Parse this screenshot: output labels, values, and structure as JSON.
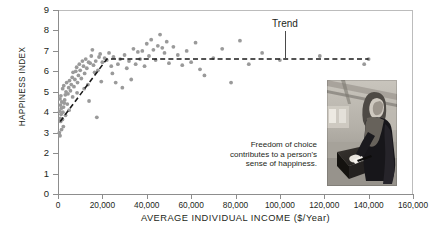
{
  "chart_data": {
    "type": "scatter",
    "title": "",
    "xlabel": "AVERAGE INDIVIDUAL INCOME ($/Year)",
    "ylabel": "HAPPINESS INDEX",
    "xlim": [
      0,
      160000
    ],
    "ylim": [
      0,
      9
    ],
    "xticks": [
      "0",
      "20,000",
      "40,000",
      "60,000",
      "80,000",
      "100,000",
      "120,000",
      "140,000",
      "160,000"
    ],
    "xtick_values": [
      0,
      20000,
      40000,
      60000,
      80000,
      100000,
      120000,
      140000,
      160000
    ],
    "yticks": [
      "0",
      "1",
      "2",
      "3",
      "4",
      "5",
      "6",
      "7",
      "8",
      "9"
    ],
    "ytick_values": [
      0,
      1,
      2,
      3,
      4,
      5,
      6,
      7,
      8,
      9
    ],
    "grid": false,
    "legend": "none",
    "marker_color": "#9a9a9a",
    "trend_color": "#1a1a1a",
    "annotations": [
      {
        "name": "trend",
        "text": "Trend",
        "x": 70000,
        "y": 8.35
      }
    ],
    "series": [
      {
        "name": "countries",
        "marker": "circle",
        "points": [
          [
            600,
            3.0
          ],
          [
            900,
            2.85
          ],
          [
            1200,
            3.55
          ],
          [
            1000,
            3.7
          ],
          [
            1400,
            3.9
          ],
          [
            800,
            4.05
          ],
          [
            1500,
            4.2
          ],
          [
            1100,
            4.35
          ],
          [
            1700,
            4.5
          ],
          [
            900,
            4.65
          ],
          [
            1300,
            4.8
          ],
          [
            2000,
            3.65
          ],
          [
            2200,
            4.0
          ],
          [
            2500,
            4.25
          ],
          [
            2800,
            4.45
          ],
          [
            3000,
            4.6
          ],
          [
            3300,
            4.85
          ],
          [
            3600,
            5.0
          ],
          [
            2100,
            5.15
          ],
          [
            2600,
            5.3
          ],
          [
            3900,
            5.45
          ],
          [
            4200,
            4.4
          ],
          [
            4500,
            4.9
          ],
          [
            4800,
            5.2
          ],
          [
            5200,
            5.55
          ],
          [
            5600,
            5.05
          ],
          [
            6000,
            5.35
          ],
          [
            6400,
            5.7
          ],
          [
            6800,
            5.95
          ],
          [
            7200,
            5.25
          ],
          [
            7600,
            5.6
          ],
          [
            8000,
            6.0
          ],
          [
            8400,
            6.2
          ],
          [
            8800,
            5.45
          ],
          [
            9200,
            5.8
          ],
          [
            9600,
            6.35
          ],
          [
            10000,
            6.05
          ],
          [
            10500,
            5.65
          ],
          [
            11000,
            6.5
          ],
          [
            11500,
            6.25
          ],
          [
            12000,
            5.9
          ],
          [
            12500,
            6.6
          ],
          [
            13000,
            6.15
          ],
          [
            13500,
            5.35
          ],
          [
            14000,
            4.55
          ],
          [
            14500,
            6.4
          ],
          [
            15000,
            6.75
          ],
          [
            15500,
            7.05
          ],
          [
            16000,
            6.3
          ],
          [
            16500,
            5.95
          ],
          [
            17000,
            6.5
          ],
          [
            17500,
            3.75
          ],
          [
            18000,
            6.05
          ],
          [
            18500,
            6.7
          ],
          [
            19000,
            6.85
          ],
          [
            19500,
            5.5
          ],
          [
            20000,
            6.45
          ],
          [
            21000,
            6.65
          ],
          [
            22000,
            6.55
          ],
          [
            23000,
            6.9
          ],
          [
            24000,
            6.25
          ],
          [
            25000,
            6.7
          ],
          [
            26000,
            5.45
          ],
          [
            27000,
            6.35
          ],
          [
            28000,
            6.6
          ],
          [
            29000,
            5.2
          ],
          [
            30000,
            6.8
          ],
          [
            31000,
            6.15
          ],
          [
            32000,
            6.5
          ],
          [
            33000,
            5.6
          ],
          [
            34000,
            7.1
          ],
          [
            35000,
            6.35
          ],
          [
            36000,
            6.95
          ],
          [
            37000,
            6.6
          ],
          [
            38000,
            7.0
          ],
          [
            39000,
            6.25
          ],
          [
            40000,
            7.35
          ],
          [
            41000,
            6.75
          ],
          [
            42000,
            7.55
          ],
          [
            43000,
            7.05
          ],
          [
            44000,
            6.55
          ],
          [
            45000,
            7.25
          ],
          [
            46000,
            7.8
          ],
          [
            47000,
            7.15
          ],
          [
            48000,
            6.9
          ],
          [
            49000,
            7.45
          ],
          [
            50000,
            6.4
          ],
          [
            52000,
            7.2
          ],
          [
            54000,
            6.8
          ],
          [
            56000,
            6.3
          ],
          [
            58000,
            7.0
          ],
          [
            60000,
            6.45
          ],
          [
            62000,
            7.4
          ],
          [
            64000,
            6.1
          ],
          [
            66000,
            5.8
          ],
          [
            70000,
            6.65
          ],
          [
            74000,
            7.1
          ],
          [
            78000,
            5.45
          ],
          [
            82000,
            7.5
          ],
          [
            86000,
            6.35
          ],
          [
            92000,
            6.9
          ],
          [
            100000,
            6.55
          ],
          [
            118000,
            6.75
          ],
          [
            138000,
            6.35
          ],
          [
            140000,
            6.6
          ],
          [
            5000,
            4.1
          ],
          [
            3400,
            3.85
          ],
          [
            2400,
            3.3
          ],
          [
            1600,
            3.15
          ],
          [
            6600,
            4.75
          ],
          [
            8600,
            4.95
          ],
          [
            11800,
            5.15
          ],
          [
            13800,
            6.45
          ],
          [
            24500,
            5.9
          ]
        ]
      }
    ],
    "trendline": {
      "style": "dashed",
      "points": [
        [
          1000,
          3.55
        ],
        [
          22000,
          6.6
        ],
        [
          140000,
          6.6
        ]
      ],
      "description": "Steep rise to about $22,000 then flat plateau at happiness 6.6"
    }
  },
  "annotation": {
    "trend_label": "Trend"
  },
  "caption": {
    "text": "Freedom of choice contributes to a person's sense of happiness."
  },
  "photo": {
    "alt": "person-casting-ballot-photo"
  }
}
